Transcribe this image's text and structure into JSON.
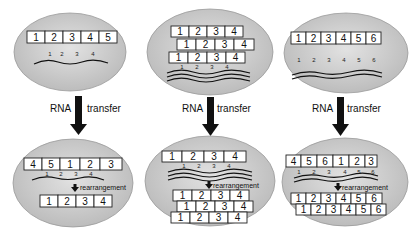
{
  "colors": {
    "cell_fill": "#c9c9c9",
    "cell_edge": "#9a9a9a",
    "arrow": "#111111",
    "box_fill": "#ffffff"
  },
  "arrow_label_left": "RNA",
  "arrow_label_right": "transfer",
  "rearrangement_label": "rearrangement",
  "panels": [
    {
      "top": {
        "box_rows": [
          [
            "1",
            "2",
            "3",
            "4",
            "5"
          ]
        ],
        "rna_indices": [
          "1",
          "2",
          "3",
          "4"
        ],
        "rna_strands": 1
      },
      "bottom": {
        "box_rows_before": [
          [
            "4",
            "5",
            "1",
            "2",
            "3"
          ]
        ],
        "rna_indices": [
          "1",
          "2",
          "3",
          "4"
        ],
        "rna_strands": 1,
        "box_rows_after": [
          [
            "1",
            "2",
            "3",
            "4"
          ]
        ]
      }
    },
    {
      "top": {
        "box_rows": [
          [
            "1",
            "2",
            "3",
            "4"
          ],
          [
            "1",
            "2",
            "3",
            "4"
          ],
          [
            "1",
            "2",
            "3",
            "4"
          ]
        ],
        "rna_indices": [
          "1",
          "2",
          "3",
          "4"
        ],
        "rna_strands": 3
      },
      "bottom": {
        "box_rows_before": [
          [
            "1",
            "2",
            "3",
            "4"
          ]
        ],
        "rna_indices": [
          "1",
          "2",
          "3",
          "4"
        ],
        "rna_strands": 3,
        "box_rows_after": [
          [
            "1",
            "2",
            "3",
            "4"
          ],
          [
            "1",
            "2",
            "3",
            "4"
          ],
          [
            "1",
            "2",
            "3",
            "4"
          ]
        ]
      }
    },
    {
      "top": {
        "box_rows": [
          [
            "1",
            "2",
            "3",
            "4",
            "5",
            "6"
          ]
        ],
        "rna_indices": [
          "1",
          "2",
          "3",
          "4",
          "5",
          "6"
        ],
        "rna_strands": 2
      },
      "bottom": {
        "box_rows_before": [
          [
            "4",
            "5",
            "6",
            "1",
            "2",
            "3"
          ]
        ],
        "rna_indices": [
          "1",
          "2",
          "3",
          "4",
          "5",
          "6"
        ],
        "rna_strands": 2,
        "box_rows_after": [
          [
            "1",
            "2",
            "3",
            "4",
            "5",
            "6"
          ],
          [
            "1",
            "2",
            "3",
            "4",
            "5",
            "6"
          ]
        ]
      }
    }
  ]
}
